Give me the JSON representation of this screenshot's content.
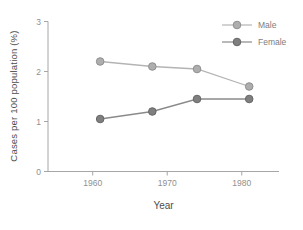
{
  "figure": {
    "background_color": "#ffffff"
  },
  "chart_data": {
    "type": "line",
    "title": "",
    "xlabel": "Year",
    "ylabel": "Cases per 100 population (%)",
    "x": [
      1961,
      1968,
      1974,
      1981
    ],
    "series": [
      {
        "name": "Male",
        "values": [
          2.2,
          2.1,
          2.05,
          1.7
        ],
        "line_color": "#b4b4b4",
        "marker_fill": "#aeaeae",
        "marker_stroke": "#8f8f8f"
      },
      {
        "name": "Female",
        "values": [
          1.05,
          1.2,
          1.45,
          1.45
        ],
        "line_color": "#8a8a8a",
        "marker_fill": "#7f7f7f",
        "marker_stroke": "#666666"
      }
    ],
    "xlim": [
      1954,
      1985
    ],
    "ylim": [
      0,
      3
    ],
    "xticks": [
      1960,
      1970,
      1980
    ],
    "yticks": [
      0,
      1,
      2,
      3
    ],
    "grid": false,
    "legend_position": "top-right",
    "axis_color": "#a6a6a6",
    "tick_label_color": "#8f8f8f",
    "axis_label_color": "#4d4d4d",
    "legend_text_color": "#7d7d7d"
  }
}
